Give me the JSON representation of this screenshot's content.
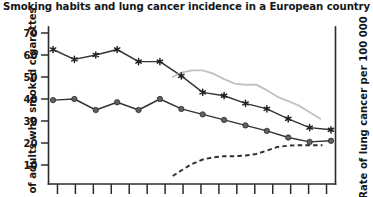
{
  "chart_data": {
    "type": "line",
    "title": "Smoking habits and lung cancer incidence in a European country",
    "xlabel": "",
    "ylabel": "of adults who smoked cigarettes",
    "ylabel_right": "Rate of lung cancer per 100 000",
    "ylim": [
      0,
      70
    ],
    "yticks": [
      10,
      20,
      30,
      40,
      50,
      60,
      70
    ],
    "ytick_labels": [
      "10",
      "20",
      "30",
      "40",
      "50",
      "60",
      "70"
    ],
    "grid": false,
    "legend": "none",
    "x_axis_tick_count": 16,
    "x_axis_labels_visible": false,
    "x": [
      1,
      2,
      3,
      4,
      5,
      6,
      7,
      8,
      9,
      10,
      11,
      12,
      13,
      14
    ],
    "series": [
      {
        "name": "Men who smoked cigarettes (%)",
        "marker": "star",
        "line_style": "solid",
        "color": "#333333",
        "axis": "left",
        "x": [
          1,
          2,
          3,
          4,
          5,
          6,
          7,
          8,
          9,
          10,
          11,
          12,
          13,
          14
        ],
        "values": [
          62.5,
          58.0,
          60.0,
          62.5,
          57.0,
          57.0,
          50.5,
          43.0,
          41.5,
          38.0,
          35.5,
          31.0,
          27.0,
          26.0
        ]
      },
      {
        "name": "Women who smoked cigarettes (%)",
        "marker": "circle",
        "line_style": "solid",
        "color": "#606060",
        "axis": "left",
        "x": [
          1,
          2,
          3,
          4,
          5,
          6,
          7,
          8,
          9,
          10,
          11,
          12,
          13,
          14
        ],
        "values": [
          39.5,
          40.0,
          35.0,
          38.5,
          35.0,
          40.0,
          35.5,
          33.0,
          30.5,
          28.0,
          25.5,
          22.5,
          20.5,
          21.0
        ]
      },
      {
        "name": "Rate of lung cancer in men per 100 000",
        "marker": "none",
        "line_style": "solid",
        "color": "#c2c2c2",
        "axis": "right",
        "x": [
          6.6,
          7.0,
          7.5,
          8.0,
          8.5,
          9.0,
          9.5,
          10.0,
          10.5,
          11.0,
          11.5,
          12.0,
          12.5,
          13.0,
          13.5
        ],
        "values": [
          50.0,
          52.0,
          53.0,
          53.0,
          51.5,
          49.0,
          47.0,
          46.5,
          46.5,
          44.0,
          41.0,
          39.0,
          37.0,
          34.0,
          31.0
        ]
      },
      {
        "name": "Rate of lung cancer in women per 100 000",
        "marker": "none",
        "line_style": "dashed",
        "color": "#2e2e2e",
        "axis": "right",
        "x": [
          6.6,
          7.0,
          7.5,
          8.0,
          8.5,
          9.0,
          9.5,
          10.0,
          10.5,
          11.0,
          11.5,
          12.0,
          12.5,
          13.0,
          13.6
        ],
        "values": [
          5.0,
          7.5,
          10.5,
          12.5,
          13.5,
          14.0,
          14.0,
          14.3,
          15.0,
          16.5,
          18.2,
          18.8,
          19.0,
          19.0,
          19.0
        ]
      }
    ]
  },
  "figure": {
    "title": "Smoking habits and lung cancer incidence in a European country",
    "left_axis_title": "of adults who smoked cigarettes",
    "right_axis_title": "Rate of lung cancer per 100 000"
  }
}
